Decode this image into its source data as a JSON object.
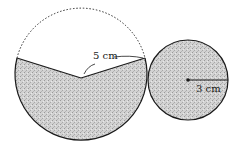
{
  "figure": {
    "large_circle": {
      "radius_label": "5 cm",
      "fill": "#c9c9c9",
      "stroke": "#1a1a1a",
      "missing_sector": "dashed arc (unshaded)"
    },
    "small_circle": {
      "radius_label": "3 cm",
      "fill": "#c9c9c9",
      "stroke": "#1a1a1a"
    }
  }
}
